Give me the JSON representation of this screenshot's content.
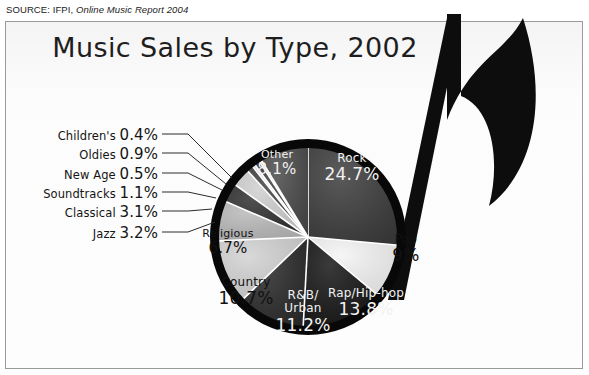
{
  "source_note": {
    "prefix": "SOURCE: IFPI,",
    "publication": "Online Music Report 2004"
  },
  "chart_data": {
    "type": "pie",
    "title": "Music Sales by Type, 2002",
    "xlabel": "",
    "ylabel": "",
    "units": "percent of sales",
    "legend": "none",
    "labels_on_slices": true,
    "categories": [
      "Rock",
      "Pop",
      "Rap/Hip-hop",
      "R&B/Urban",
      "Country",
      "Religious",
      "Jazz",
      "Classical",
      "Soundtracks",
      "New Age",
      "Oldies",
      "Children's",
      "Other"
    ],
    "values": [
      24.7,
      9,
      13.8,
      11.2,
      10.7,
      6.7,
      3.2,
      3.1,
      1.1,
      0.5,
      0.9,
      0.4,
      8.1
    ],
    "slices": [
      {
        "name": "Rock",
        "value": 24.7,
        "display": "24.7%",
        "fill": "#3c3c3c",
        "text": "light",
        "placement": "inside",
        "cx": 352,
        "cy": 168
      },
      {
        "name": "Pop",
        "value": 9,
        "display": "9%",
        "fill": "#f4f4f4",
        "text": "dark",
        "placement": "inside",
        "cx": 406,
        "cy": 249
      },
      {
        "name": "Rap/Hip-hop",
        "value": 13.8,
        "display": "13.8%",
        "fill": "#151515",
        "text": "light",
        "placement": "inside",
        "cx": 366,
        "cy": 303
      },
      {
        "name": "R&B/Urban",
        "value": 11.2,
        "display": "11.2%",
        "fill": "#2a2a2a",
        "text": "light",
        "placement": "inside",
        "cx": 303,
        "cy": 312,
        "line1": "R&B/",
        "line2": "Urban"
      },
      {
        "name": "Country",
        "value": 10.7,
        "display": "10.7%",
        "fill": "#d2d2d2",
        "text": "dark",
        "placement": "inside",
        "cx": 246,
        "cy": 292
      },
      {
        "name": "Religious",
        "value": 6.7,
        "display": "6.7%",
        "fill": "#b9b9b9",
        "text": "dark",
        "placement": "inside",
        "cx": 228,
        "cy": 243
      },
      {
        "name": "Jazz",
        "value": 3.2,
        "display": "3.2%",
        "fill": "#2f2f2f",
        "text": "dark",
        "placement": "callout",
        "lx": 158,
        "ly": 232,
        "tipx": 215,
        "tipy": 222
      },
      {
        "name": "Classical",
        "value": 3.1,
        "display": "3.1%",
        "fill": "#cfcfcf",
        "text": "dark",
        "placement": "callout",
        "lx": 158,
        "ly": 211,
        "tipx": 212,
        "tipy": 209
      },
      {
        "name": "Soundtracks",
        "value": 1.1,
        "display": "1.1%",
        "fill": "#404040",
        "text": "dark",
        "placement": "callout",
        "lx": 158,
        "ly": 192,
        "tipx": 216,
        "tipy": 198
      },
      {
        "name": "New Age",
        "value": 0.5,
        "display": "0.5%",
        "fill": "#e6e6e6",
        "text": "dark",
        "placement": "callout",
        "lx": 158,
        "ly": 173,
        "tipx": 222,
        "tipy": 190
      },
      {
        "name": "Oldies",
        "value": 0.9,
        "display": "0.9%",
        "fill": "#3a3a3a",
        "text": "dark",
        "placement": "callout",
        "lx": 158,
        "ly": 153,
        "tipx": 226,
        "tipy": 184
      },
      {
        "name": "Children's",
        "value": 0.4,
        "display": "0.4%",
        "fill": "#dcdcdc",
        "text": "dark",
        "placement": "callout",
        "lx": 158,
        "ly": 134,
        "tipx": 232,
        "tipy": 178
      },
      {
        "name": "Other",
        "value": 8.1,
        "display": "8.1%",
        "fill": "#4a4a4a",
        "text": "light",
        "placement": "inside",
        "cx": 277,
        "cy": 164
      }
    ],
    "geometry": {
      "cx": 308,
      "cy": 237,
      "radius": 98,
      "ring_width": 9,
      "ring_color": "#080808",
      "start_angle_deg": -90,
      "direction": "clockwise",
      "separator_color": "#ffffff"
    }
  },
  "decor": {
    "music_note": {
      "name": "eighth-note",
      "color": "#0d0d0d",
      "stem_top_x": 447,
      "stem_top_y": 14,
      "stem_bottom_x": 392,
      "stem_bottom_y": 300
    }
  },
  "colors": {
    "page_background": "#ffffff",
    "panel_background": "#fbfbfb",
    "frame_border": "#9a9a9a",
    "title_text": "#1e1e1e",
    "label_light": "#f2f2f2",
    "label_dark": "#111111",
    "leader_line": "#2b2b2b"
  }
}
